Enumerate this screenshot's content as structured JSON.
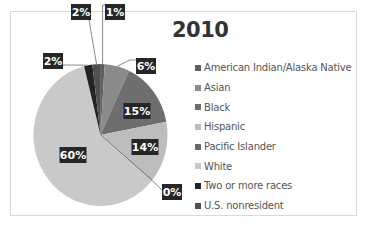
{
  "chart_data": {
    "type": "pie",
    "title": "2010",
    "start_angle": "12 o'clock",
    "direction": "clockwise",
    "legend_position": "right",
    "slices": [
      {
        "name": "American Indian/Alaska Native",
        "value": 1,
        "label": "1%",
        "color": "#5f5f5f"
      },
      {
        "name": "Asian",
        "value": 6,
        "label": "6%",
        "color": "#8a8a8a"
      },
      {
        "name": "Black",
        "value": 15,
        "label": "15%",
        "color": "#6e6e6e"
      },
      {
        "name": "Hispanic",
        "value": 14,
        "label": "14%",
        "color": "#bdbdbd"
      },
      {
        "name": "Pacific Islander",
        "value": 0,
        "label": "0%",
        "color": "#6a6a6a"
      },
      {
        "name": "White",
        "value": 60,
        "label": "60%",
        "color": "#c9c9c9"
      },
      {
        "name": "Two or more races",
        "value": 2,
        "label": "2%",
        "color": "#232323"
      },
      {
        "name": "U.S. nonresident",
        "value": 2,
        "label": "2%",
        "color": "#505050"
      }
    ]
  }
}
